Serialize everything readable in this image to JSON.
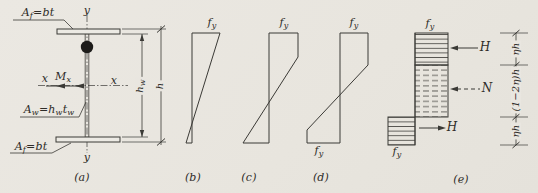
{
  "colors": {
    "paper": "#e9e6e0",
    "ink": "#3b3a36"
  },
  "section": {
    "top_flange_label": {
      "base": "A",
      "sub": "f",
      "rest": "=bt"
    },
    "bottom_flange_label": {
      "base": "A",
      "sub": "f",
      "rest": "=bt"
    },
    "web_label": {
      "base": "A",
      "sub": "w",
      "p1": "=h",
      "p1sub": "w",
      "p2": "t",
      "p2sub": "w"
    },
    "axis_y_top": "y",
    "axis_y_bottom": "y",
    "axis_x_left": "x",
    "axis_x_right": "x",
    "moment_label": {
      "base": "M",
      "sub": "x"
    },
    "dim_web_height": {
      "base": "h",
      "sub": "w"
    },
    "dim_total_height": "h",
    "caption": "(a)"
  },
  "stress_b": {
    "fy_top": {
      "base": "f",
      "sub": "y"
    },
    "caption": "(b)"
  },
  "stress_c": {
    "fy_top": {
      "base": "f",
      "sub": "y"
    },
    "caption": "(c)"
  },
  "stress_d": {
    "fy_top": {
      "base": "f",
      "sub": "y"
    },
    "fy_bottom": {
      "base": "f",
      "sub": "y"
    },
    "caption": "(d)"
  },
  "stress_e": {
    "fy_top": {
      "base": "f",
      "sub": "y"
    },
    "fy_bottom": {
      "base": "f",
      "sub": "y"
    },
    "force_h_top": "H",
    "force_n": "N",
    "force_h_bottom": "H",
    "dim_top": "ηh",
    "dim_mid": "(1−2η)h",
    "dim_bottom": "ηh",
    "caption": "(e)"
  }
}
